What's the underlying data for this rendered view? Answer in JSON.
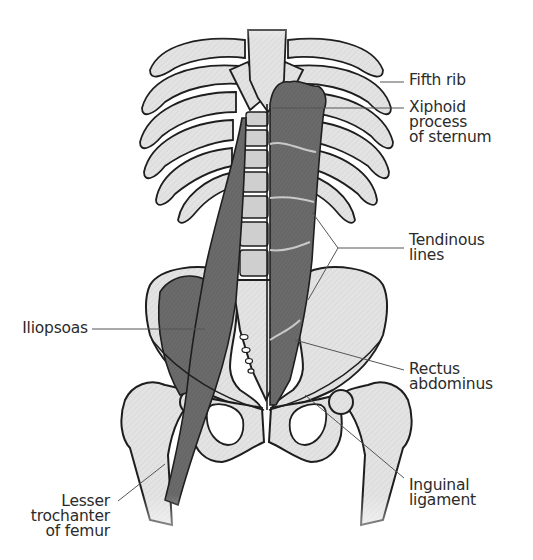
{
  "figure": {
    "colors": {
      "bone_fill": "#e3e3e3",
      "bone_outline": "#1e1e1e",
      "muscle_fill": "#6b6b6b",
      "muscle_dark": "#555555",
      "tendinous_line": "#c9c9c9",
      "leader_line": "#555555",
      "label_text": "#2b2b2b",
      "background": "#ffffff"
    }
  },
  "labels": {
    "fifth_rib": {
      "lines": [
        "Fifth rib"
      ]
    },
    "xiphoid": {
      "lines": [
        "Xiphoid",
        "process",
        "of sternum"
      ]
    },
    "tendinous": {
      "lines": [
        "Tendinous",
        "lines"
      ]
    },
    "iliopsoas": {
      "lines": [
        "Iliopsoas"
      ]
    },
    "rectus": {
      "lines": [
        "Rectus",
        "abdominus"
      ]
    },
    "inguinal": {
      "lines": [
        "Inguinal",
        "ligament"
      ]
    },
    "lesser_trochanter": {
      "lines": [
        "Lesser",
        "trochanter",
        "of femur"
      ]
    }
  }
}
